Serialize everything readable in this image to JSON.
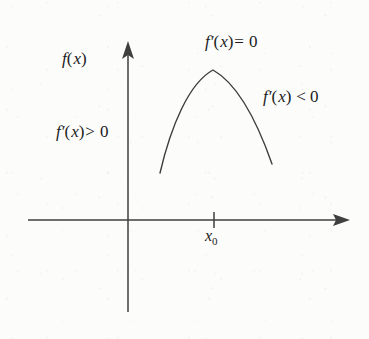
{
  "figure": {
    "background_color": "#fcfcfb",
    "ink_color": "#3a3a3a",
    "text_color": "#1b1b1b"
  },
  "axes": {
    "x_axis": {
      "name": "x-axis",
      "start": [
        28,
        220
      ],
      "end": [
        350,
        220
      ],
      "has_arrow": true,
      "arrow_direction": "right"
    },
    "y_axis": {
      "name": "y-axis",
      "start": [
        128,
        312
      ],
      "end": [
        128,
        42
      ],
      "has_arrow": true,
      "arrow_direction": "up"
    },
    "origin": [
      128,
      220
    ],
    "tick": {
      "name": "x0-tick",
      "x": 214,
      "y": 220,
      "half_length": 7,
      "label": "x0"
    }
  },
  "curve": {
    "name": "function-curve",
    "type": "concave-down-arc",
    "peak": [
      213,
      70
    ],
    "left_endpoint": [
      160,
      173
    ],
    "right_endpoint": [
      272,
      164
    ],
    "path": "M 160,173 C 171,126 189,83 213,70 C 238,84 258,124 272,164",
    "stroke_width": 1.4
  },
  "labels": {
    "function": {
      "name": "function-label",
      "text": "f(x)",
      "parts": {
        "f": "f",
        "paren_open": "(",
        "x": "x",
        "paren_close": ")"
      }
    },
    "derivative_zero": {
      "name": "derivative-zero-label",
      "text": "f'(x)= 0",
      "parts": {
        "f": "f",
        "prime": "′",
        "paren_open": "(",
        "x": "x",
        "paren_close": ")",
        "relation": "=",
        "value": "0"
      },
      "meaning": "derivative equals zero at the maximum"
    },
    "derivative_negative": {
      "name": "derivative-negative-label",
      "text": "f'(x) < 0",
      "parts": {
        "f": "f",
        "prime": "′",
        "paren_open": "(",
        "x": "x",
        "paren_close": ")",
        "relation": "<",
        "value": "0"
      },
      "meaning": "derivative negative to the right of x0"
    },
    "derivative_positive": {
      "name": "derivative-positive-label",
      "text": "f'(x) > 0",
      "parts": {
        "f": "f",
        "prime": "′",
        "paren_open": "(",
        "x": "x",
        "paren_close": ")",
        "relation": ">",
        "value": "0"
      },
      "meaning": "derivative positive to the left of x0"
    },
    "x0": {
      "name": "x0-label",
      "text": "x0",
      "parts": {
        "base": "x",
        "subscript": "0"
      }
    }
  }
}
